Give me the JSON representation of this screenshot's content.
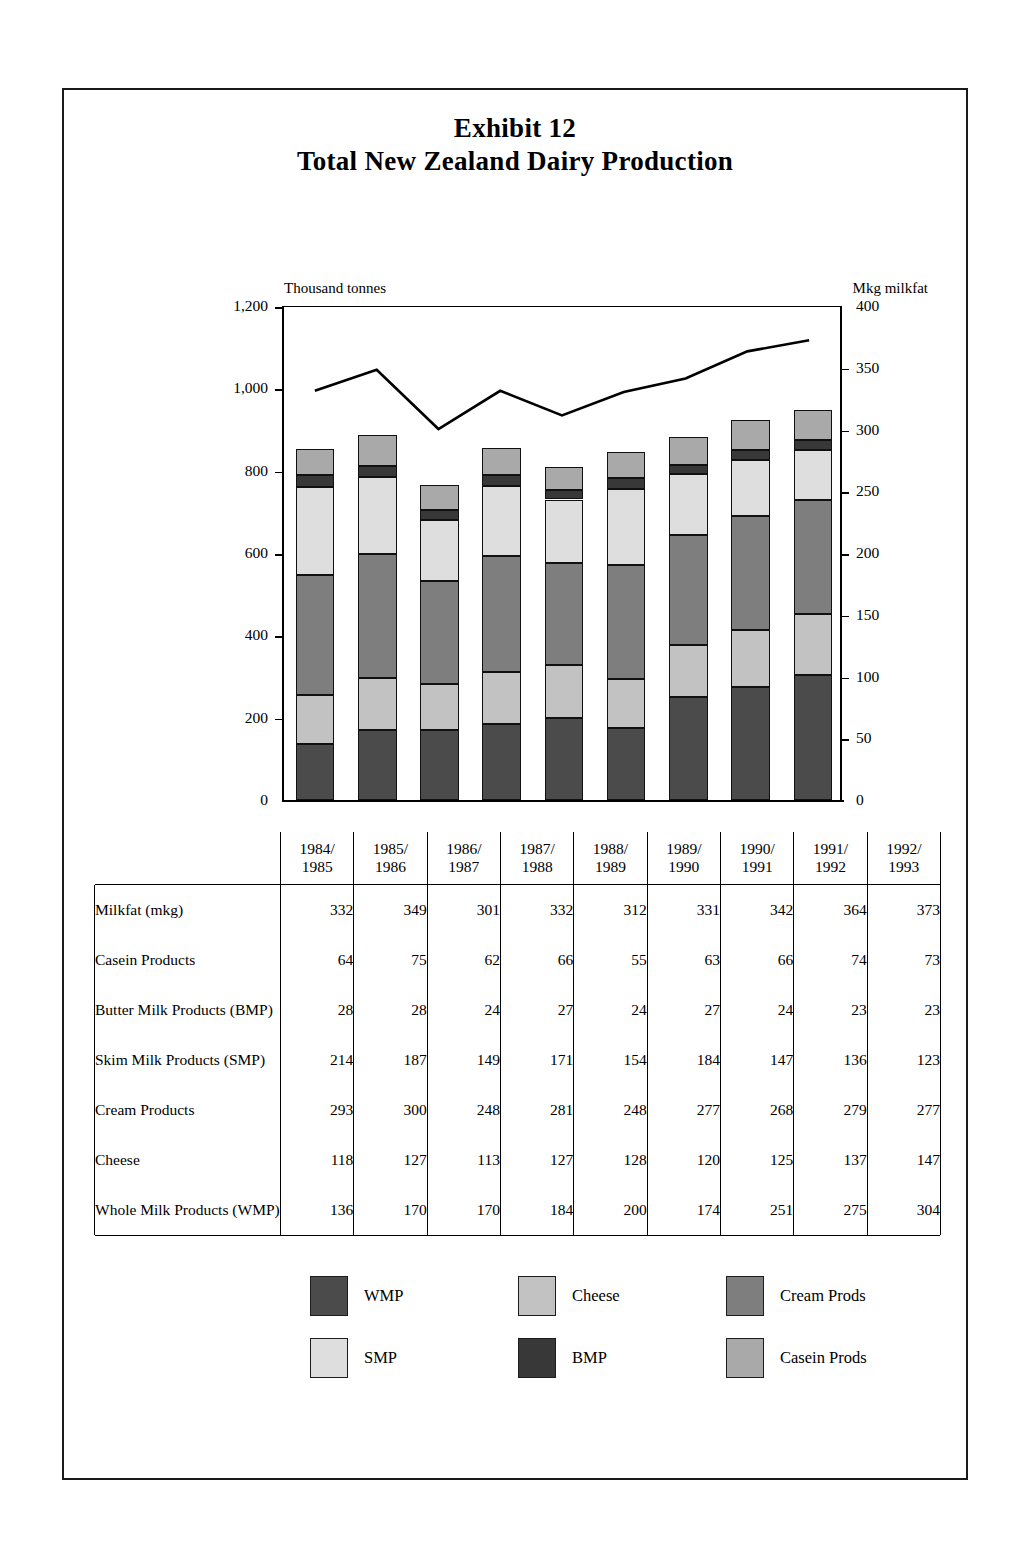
{
  "title": {
    "line1": "Exhibit 12",
    "line2": "Total New Zealand Dairy Production"
  },
  "chart_data": {
    "type": "bar",
    "title": "Total New Zealand Dairy Production",
    "subtitle": "Exhibit 12",
    "stacked": true,
    "grid": false,
    "legend_position": "bottom",
    "categories": [
      "1984/\n1985",
      "1985/\n1986",
      "1986/\n1987",
      "1987/\n1988",
      "1988/\n1989",
      "1989/\n1990",
      "1990/\n1991",
      "1991/\n1992",
      "1992/\n1993"
    ],
    "category_labels": [
      {
        "top": "1984/",
        "bottom": "1985"
      },
      {
        "top": "1985/",
        "bottom": "1986"
      },
      {
        "top": "1986/",
        "bottom": "1987"
      },
      {
        "top": "1987/",
        "bottom": "1988"
      },
      {
        "top": "1988/",
        "bottom": "1989"
      },
      {
        "top": "1989/",
        "bottom": "1990"
      },
      {
        "top": "1990/",
        "bottom": "1991"
      },
      {
        "top": "1991/",
        "bottom": "1992"
      },
      {
        "top": "1992/",
        "bottom": "1993"
      }
    ],
    "ylabel": "Thousand tonnes",
    "ylabel_right": "Mkg milkfat",
    "ylim": [
      0,
      1200
    ],
    "ylim_right": [
      0,
      400
    ],
    "yticks": [
      0,
      200,
      400,
      600,
      800,
      1000,
      1200
    ],
    "ytick_labels": [
      "0",
      "200",
      "400",
      "600",
      "800",
      "1,000",
      "1,200"
    ],
    "yticks_right": [
      0,
      50,
      100,
      150,
      200,
      250,
      300,
      350,
      400
    ],
    "ytick_labels_right": [
      "0",
      "50",
      "100",
      "150",
      "200",
      "250",
      "300",
      "350",
      "400"
    ],
    "series": [
      {
        "name": "WMP",
        "legend": "WMP",
        "color": "#4b4b4b",
        "values": [
          136,
          170,
          170,
          184,
          200,
          174,
          251,
          275,
          304
        ]
      },
      {
        "name": "Cheese",
        "legend": "Cheese",
        "color": "#c2c2c2",
        "values": [
          118,
          127,
          113,
          127,
          128,
          120,
          125,
          137,
          147
        ]
      },
      {
        "name": "Cream Prods",
        "legend": "Cream Prods",
        "color": "#7e7e7e",
        "values": [
          293,
          300,
          248,
          281,
          248,
          277,
          268,
          279,
          277
        ]
      },
      {
        "name": "SMP",
        "legend": "SMP",
        "color": "#dedede",
        "values": [
          214,
          187,
          149,
          171,
          154,
          184,
          147,
          136,
          123
        ]
      },
      {
        "name": "BMP",
        "legend": "BMP",
        "color": "#383838",
        "values": [
          28,
          28,
          24,
          27,
          24,
          27,
          24,
          23,
          23
        ]
      },
      {
        "name": "Casein Prods",
        "legend": "Casein Prods",
        "color": "#a9a9a9",
        "values": [
          64,
          75,
          62,
          66,
          55,
          63,
          66,
          74,
          73
        ]
      }
    ],
    "line_series": {
      "name": "Milkfat (mkg)",
      "axis": "right",
      "color": "#000000",
      "values": [
        332,
        349,
        301,
        332,
        312,
        331,
        342,
        364,
        373
      ]
    }
  },
  "table": {
    "year_headers": [
      {
        "top": "1984/",
        "bottom": "1985"
      },
      {
        "top": "1985/",
        "bottom": "1986"
      },
      {
        "top": "1986/",
        "bottom": "1987"
      },
      {
        "top": "1987/",
        "bottom": "1988"
      },
      {
        "top": "1988/",
        "bottom": "1989"
      },
      {
        "top": "1989/",
        "bottom": "1990"
      },
      {
        "top": "1990/",
        "bottom": "1991"
      },
      {
        "top": "1991/",
        "bottom": "1992"
      },
      {
        "top": "1992/",
        "bottom": "1993"
      }
    ],
    "rows": [
      {
        "label": "Milkfat (mkg)",
        "values": [
          "332",
          "349",
          "301",
          "332",
          "312",
          "331",
          "342",
          "364",
          "373"
        ]
      },
      {
        "label": "Casein Products",
        "values": [
          "64",
          "75",
          "62",
          "66",
          "55",
          "63",
          "66",
          "74",
          "73"
        ]
      },
      {
        "label": "Butter Milk Products (BMP)",
        "values": [
          "28",
          "28",
          "24",
          "27",
          "24",
          "27",
          "24",
          "23",
          "23"
        ]
      },
      {
        "label": "Skim Milk Products (SMP)",
        "values": [
          "214",
          "187",
          "149",
          "171",
          "154",
          "184",
          "147",
          "136",
          "123"
        ]
      },
      {
        "label": "Cream Products",
        "values": [
          "293",
          "300",
          "248",
          "281",
          "248",
          "277",
          "268",
          "279",
          "277"
        ]
      },
      {
        "label": "Cheese",
        "values": [
          "118",
          "127",
          "113",
          "127",
          "128",
          "120",
          "125",
          "137",
          "147"
        ]
      },
      {
        "label": "Whole Milk Products (WMP)",
        "values": [
          "136",
          "170",
          "170",
          "184",
          "200",
          "174",
          "251",
          "275",
          "304"
        ]
      }
    ]
  },
  "legend": {
    "items": [
      {
        "label": "WMP",
        "color": "#4b4b4b"
      },
      {
        "label": "Cheese",
        "color": "#c2c2c2"
      },
      {
        "label": "Cream Prods",
        "color": "#7e7e7e"
      },
      {
        "label": "SMP",
        "color": "#dedede"
      },
      {
        "label": "BMP",
        "color": "#383838"
      },
      {
        "label": "Casein Prods",
        "color": "#a9a9a9"
      }
    ]
  }
}
